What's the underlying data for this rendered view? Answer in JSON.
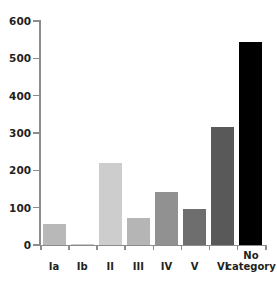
{
  "chart_data": {
    "type": "bar",
    "title": "",
    "subtitle": "",
    "xlabel": "",
    "ylabel": "",
    "categories": [
      "Ia",
      "Ib",
      "II",
      "III",
      "IV",
      "V",
      "VI",
      "No\ncategory"
    ],
    "category_labels_flat": [
      "Ia",
      "Ib",
      "II",
      "III",
      "IV",
      "V",
      "VI",
      "No category"
    ],
    "values": [
      55,
      3,
      220,
      72,
      143,
      96,
      315,
      543
    ],
    "bar_colors": [
      "#b8b8b8",
      "#c9c9c9",
      "#cdcdcd",
      "#b5b5b5",
      "#919191",
      "#6e6e6e",
      "#595959",
      "#000000"
    ],
    "ylim": [
      0,
      600
    ],
    "yticks": [
      0,
      100,
      200,
      300,
      400,
      500,
      600
    ],
    "ytick_labels": [
      "0",
      "100",
      "200",
      "300",
      "400",
      "500",
      "600"
    ],
    "grid": false,
    "legend": null,
    "legend_position": "none",
    "axis_color": "#8c8c8c",
    "text_color": "#231f20",
    "background": "#ffffff"
  }
}
